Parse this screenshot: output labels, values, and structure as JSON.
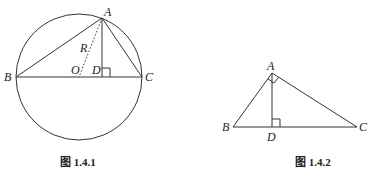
{
  "figure1": {
    "caption": "图 1.4.1",
    "labels": {
      "A": "A",
      "B": "B",
      "C": "C",
      "D": "D",
      "O": "O",
      "R": "R"
    }
  },
  "figure2": {
    "caption": "图 1.4.2",
    "labels": {
      "A": "A",
      "B": "B",
      "C": "C",
      "D": "D"
    }
  },
  "colors": {
    "stroke": "#333333",
    "background": "#ffffff"
  }
}
